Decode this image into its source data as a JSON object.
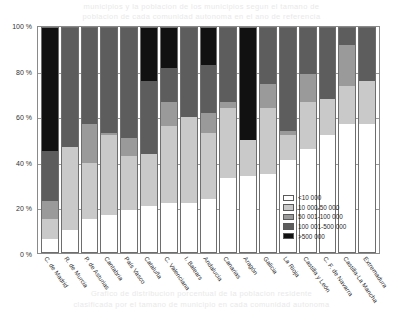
{
  "page": {
    "bleed_top_line1": "municipios y la poblacion de los municipios segun el tamano de",
    "bleed_top_line2": "poblacion de cada comunidad autonoma en el ano de referencia",
    "bleed_bottom_line1": "Grafico de distribucion porcentual de la poblacion residente",
    "bleed_bottom_line2": "clasificada por el tamano de municipio en cada comunidad autonoma"
  },
  "chart_data": {
    "type": "bar",
    "subtype": "stacked-percent",
    "title": "",
    "subtitle": "",
    "xlabel": "",
    "ylabel": "",
    "ylim": [
      0,
      100
    ],
    "yticks": [
      "0 %",
      "20 %",
      "40 %",
      "60 %",
      "80 %",
      "100 %"
    ],
    "ytick_values": [
      0,
      20,
      40,
      60,
      80,
      100
    ],
    "grid": true,
    "legend_position": "inside-bottom-right",
    "colors": {
      "s0": "#ffffff",
      "s1": "#c9c9c9",
      "s2": "#9a9a9a",
      "s3": "#5d5d5d",
      "s4": "#111111"
    },
    "categories": [
      "C. de Madrid",
      "R. de Murcia",
      "P. de Asturias",
      "Cantabria",
      "País Vasco",
      "Cataluña",
      "C. Valenciana",
      "I. Balears",
      "Andalucía",
      "Canarias",
      "Aragón",
      "Galicia",
      "La Rioja",
      "Castilla y León",
      "C. F. de Navarra",
      "Castilla-La Mancha",
      "Extremadura"
    ],
    "series": [
      {
        "name": "<10 000",
        "color": "#ffffff",
        "values": [
          6,
          10,
          15,
          17,
          19,
          21,
          22,
          22,
          24,
          33,
          34,
          35,
          41,
          46,
          52,
          57,
          57
        ]
      },
      {
        "name": "10 000-50 000",
        "color": "#c9c9c9",
        "values": [
          9,
          37,
          25,
          35,
          24,
          23,
          34,
          38,
          29,
          31,
          16,
          29,
          11,
          21,
          16,
          17,
          19
        ]
      },
      {
        "name": "50 001-100 000",
        "color": "#9a9a9a",
        "values": [
          8,
          0,
          17,
          1,
          8,
          0,
          11,
          0,
          9,
          3,
          0,
          11,
          2,
          12,
          0,
          18,
          0
        ]
      },
      {
        "name": "100 001-500 000",
        "color": "#5d5d5d",
        "values": [
          22,
          53,
          43,
          47,
          49,
          32,
          15,
          40,
          21,
          33,
          0,
          25,
          46,
          21,
          32,
          8,
          24
        ]
      },
      {
        "name": ">500 000",
        "color": "#111111",
        "values": [
          55,
          0,
          0,
          0,
          0,
          24,
          18,
          0,
          17,
          0,
          50,
          0,
          0,
          0,
          0,
          0,
          0
        ]
      }
    ],
    "legend": [
      {
        "label": "<10 000",
        "color": "#ffffff"
      },
      {
        "label": "10 000-50 000",
        "color": "#c9c9c9"
      },
      {
        "label": "50 001-100 000",
        "color": "#9a9a9a"
      },
      {
        "label": "100 001-500 000",
        "color": "#5d5d5d"
      },
      {
        "label": ">500 000",
        "color": "#111111"
      }
    ]
  }
}
